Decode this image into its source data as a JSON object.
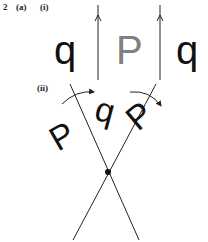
{
  "question": {
    "number": "2",
    "part": "(a)",
    "sub_i": "(i)",
    "sub_ii": "(ii)"
  },
  "part_i": {
    "description": "Reflections in two parallel mirror lines",
    "letters": [
      {
        "char": "q",
        "color": "#111111"
      },
      {
        "char": "P",
        "color": "#808080"
      },
      {
        "char": "q",
        "color": "#111111"
      }
    ],
    "mirror_lines": 2
  },
  "part_ii": {
    "description": "Reflections in two intersecting mirror lines, producing rotation",
    "letters": [
      {
        "char": "P",
        "rotation": -35
      },
      {
        "char": "q",
        "rotation": 15
      },
      {
        "char": "P",
        "rotation": 40
      }
    ],
    "has_intersection_point": true
  },
  "colors": {
    "line": "#222222",
    "original_letter": "#808080",
    "image_letter": "#111111"
  }
}
